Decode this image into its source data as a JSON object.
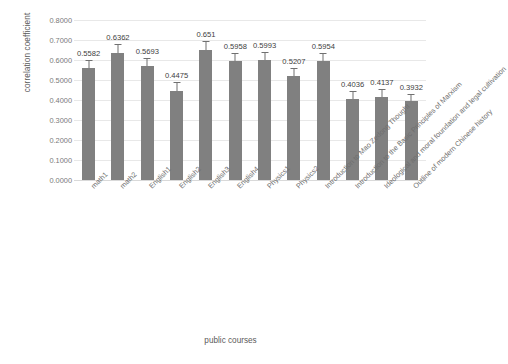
{
  "chart_data": {
    "type": "bar",
    "title": "",
    "xlabel": "public courses",
    "ylabel": "correlation coefficient",
    "ylim": [
      0.0,
      0.8
    ],
    "grid": true,
    "legend": null,
    "ytick_labels": [
      "0.8000",
      "0.7000",
      "0.6000",
      "0.5000",
      "0.4000",
      "0.3000",
      "0.2000",
      "0.1000",
      "0.0000"
    ],
    "ytick_values": [
      0.8,
      0.7,
      0.6,
      0.5,
      0.4,
      0.3,
      0.2,
      0.1,
      0.0
    ],
    "categories": [
      "math1",
      "math2",
      "English1",
      "English2",
      "English3",
      "English4",
      "Physics1",
      "Physics2",
      "Introduction to Mao Zedong Thought",
      "Introduction to the Basic Principles of Marxism",
      "Ideological and moral foundation and legal cultivation",
      "Outline of modern Chinese history"
    ],
    "values": [
      0.5582,
      0.6362,
      0.5693,
      0.4475,
      0.651,
      0.5958,
      0.5993,
      0.5207,
      0.5954,
      0.4036,
      0.4137,
      0.3932
    ],
    "data_labels": [
      "0.5582",
      "0.6362",
      "0.5693",
      "0.4475",
      "0.651",
      "0.5958",
      "0.5993",
      "0.5207",
      "0.5954",
      "0.4036",
      "0.4137",
      "0.3932"
    ],
    "error_bars": [
      0.018,
      0.018,
      0.018,
      0.016,
      0.018,
      0.016,
      0.016,
      0.016,
      0.016,
      0.014,
      0.014,
      0.014
    ],
    "bar_color": "#808080",
    "gridline_color": "#e8e8e8",
    "label_color": "#6e6e6e"
  }
}
